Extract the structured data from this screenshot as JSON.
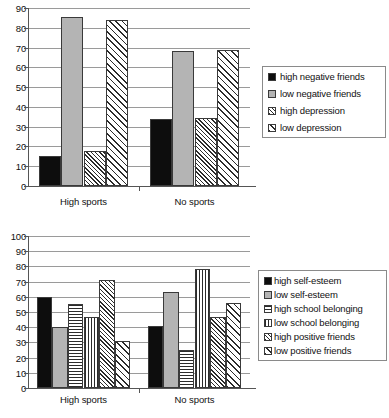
{
  "chart_data": [
    {
      "id": "top",
      "type": "bar",
      "title": "",
      "xlabel": "",
      "ylabel": "",
      "ylim": [
        0,
        90
      ],
      "ytick_step": 10,
      "yticks": [
        0,
        10,
        20,
        30,
        40,
        50,
        60,
        70,
        80,
        90
      ],
      "grid": true,
      "legend_position": "right",
      "categories": [
        "High sports",
        "No sports"
      ],
      "series": [
        {
          "name": "high negative friends",
          "pattern": "solid-black",
          "values": [
            15,
            34
          ]
        },
        {
          "name": "low negative friends",
          "pattern": "gray",
          "values": [
            85.5,
            68.5
          ]
        },
        {
          "name": "high depression",
          "pattern": "diag-dense",
          "values": [
            17.5,
            34.5
          ]
        },
        {
          "name": "low depression",
          "pattern": "diag-sparse",
          "values": [
            84,
            69
          ]
        }
      ]
    },
    {
      "id": "bottom",
      "type": "bar",
      "title": "",
      "xlabel": "",
      "ylabel": "",
      "ylim": [
        0,
        100
      ],
      "ytick_step": 10,
      "yticks": [
        0,
        10,
        20,
        30,
        40,
        50,
        60,
        70,
        80,
        90,
        100
      ],
      "grid": true,
      "legend_position": "right",
      "categories": [
        "High sports",
        "No sports"
      ],
      "series": [
        {
          "name": "high self-esteem",
          "pattern": "solid-black",
          "values": [
            60,
            41
          ]
        },
        {
          "name": "low self-esteem",
          "pattern": "gray",
          "values": [
            40,
            63
          ]
        },
        {
          "name": "high school belonging",
          "pattern": "horiz",
          "values": [
            55,
            25
          ]
        },
        {
          "name": "low school belonging",
          "pattern": "vert",
          "values": [
            47,
            78
          ]
        },
        {
          "name": "high positive friends",
          "pattern": "diag-dense",
          "values": [
            71,
            47
          ]
        },
        {
          "name": "low positive friends",
          "pattern": "diag-sparse",
          "values": [
            31,
            56
          ]
        }
      ]
    }
  ],
  "colors": {
    "series_black": "#0d0d0d",
    "series_gray": "#b4b4b4",
    "gridline": "#9a9a9a",
    "axis": "#555555",
    "text": "#111111"
  }
}
